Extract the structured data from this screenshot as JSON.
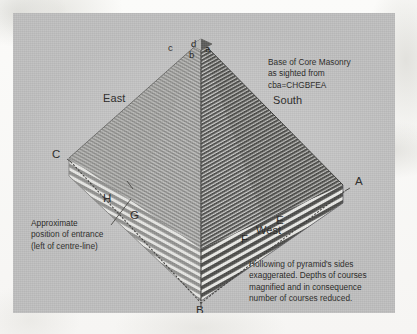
{
  "figure": {
    "plate_color": "#c5c5c5",
    "ink_color": "#262523"
  },
  "notes": {
    "top_right": "Base of Core Masonry\nas sighted from\ncba=CHGBFEA",
    "bottom_right": "Hollowing of pyramid's sides\nexaggerated. Depths of courses\nmagnified and in consequence\nnumber of courses reduced.",
    "bottom_left": "Approximate\nposition of entrance\n(left of centre-line)"
  },
  "compass": {
    "east": "East",
    "south": "South",
    "west": "West"
  },
  "corner_labels": {
    "A": "A",
    "B": "B",
    "C": "C",
    "E": "E",
    "F": "F",
    "G": "G",
    "H": "H"
  },
  "apex_labels": {
    "a": "a",
    "b": "b",
    "c": "c",
    "d": "d"
  }
}
